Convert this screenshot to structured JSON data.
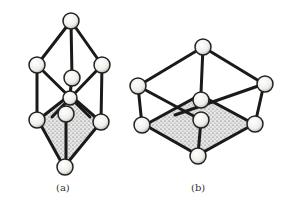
{
  "figures": [
    {
      "id": "a",
      "caption": "(a)",
      "description": "Vertically elongated cage: top atom, upper square of four atoms, shaded lower pyramid ending in bottom atom"
    },
    {
      "id": "b",
      "caption": "(b)",
      "description": "Flattened cage: top atom, square of four atoms, shaded lower pyramid ending in bottom atom"
    }
  ],
  "colors": {
    "bond": "#1a1a1a",
    "atom_fill": "#f2f2ee",
    "shading": "#8a8a8a"
  }
}
